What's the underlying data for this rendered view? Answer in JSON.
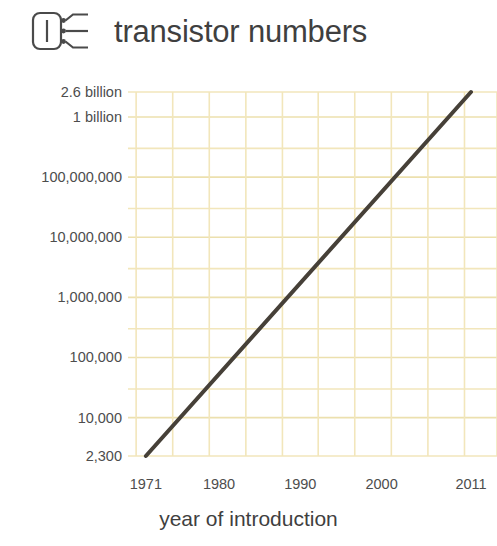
{
  "header": {
    "title": "transistor numbers",
    "icon": "transistor-chip-icon"
  },
  "colors": {
    "grid": "#f2e6bb",
    "grid_major": "#ece0ae",
    "line": "#464038",
    "text": "#4d4d4d",
    "background": "#ffffff"
  },
  "chart_data": {
    "type": "line",
    "title": "transistor numbers",
    "xlabel": "year of introduction",
    "ylabel": "",
    "yscale": "log",
    "xlim": [
      1968.8,
      2014.2
    ],
    "ylim": [
      2300,
      2600000000
    ],
    "grid": true,
    "legend": null,
    "x_ticks": [
      {
        "label": "1971",
        "value": 1971
      },
      {
        "label": "1980",
        "value": 1980
      },
      {
        "label": "1990",
        "value": 1990
      },
      {
        "label": "2000",
        "value": 2000
      },
      {
        "label": "2011",
        "value": 2011
      }
    ],
    "y_ticks": [
      {
        "label": "2.6 billion",
        "value": 2600000000
      },
      {
        "label": "1 billion",
        "value": 1000000000
      },
      {
        "label": "100,000,000",
        "value": 100000000
      },
      {
        "label": "10,000,000",
        "value": 10000000
      },
      {
        "label": "1,000,000",
        "value": 1000000
      },
      {
        "label": "100,000",
        "value": 100000
      },
      {
        "label": "10,000",
        "value": 10000
      },
      {
        "label": "2,300",
        "value": 2300
      }
    ],
    "series": [
      {
        "name": "transistor count",
        "x": [
          1971,
          2011
        ],
        "values": [
          2300,
          2600000000
        ]
      }
    ],
    "x_gridlines": [
      1969.8,
      1974.3,
      1978.8,
      1983.3,
      1987.8,
      1992.2,
      1996.7,
      2001.2,
      2005.7,
      2010.2,
      2014.2
    ],
    "y_gridlines_decades": [
      10000,
      100000,
      1000000,
      10000000,
      100000000,
      1000000000
    ],
    "y_gridlines_minor": [
      30000,
      300000,
      3000000,
      30000000,
      300000000,
      2600000000
    ]
  }
}
